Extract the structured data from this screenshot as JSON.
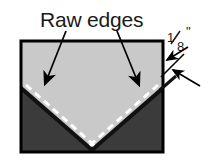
{
  "diagram": {
    "title": "Raw edges",
    "labels": {
      "raw_edges": "Raw edges",
      "seam_allowance_numerator": "1",
      "seam_allowance_denominator": "8",
      "seam_allowance_unit": "\""
    },
    "colors": {
      "background": "#ffffff",
      "fabric_light": "#c9c9c9",
      "fabric_dark": "#3b3b3b",
      "outline": "#000000",
      "stitch_line": "#ffffff",
      "text": "#1a1a1a",
      "arrow": "#000000"
    },
    "panel": {
      "x": 21,
      "y": 41,
      "width": 142,
      "height": 111,
      "border_width": 3
    },
    "fold": {
      "left_start_x": 21,
      "left_start_y": 88,
      "vertex_x": 92,
      "vertex_y": 150,
      "right_end_x": 163,
      "right_end_y": 88,
      "edge_width": 4,
      "overshoot_x": 14,
      "overshoot_y": 12
    },
    "stitching": {
      "dash_pattern": "7 5",
      "width": 3,
      "offset": 7
    },
    "callouts": [
      {
        "name": "raw-edge-left",
        "from_x": 66,
        "from_y": 27,
        "to_x": 44,
        "to_y": 86
      },
      {
        "name": "raw-edge-right",
        "from_x": 117,
        "from_y": 27,
        "to_x": 140,
        "to_y": 87
      }
    ],
    "dimension": {
      "name": "seam-allowance",
      "upper_leader_from_x": 187,
      "upper_leader_from_y": 46,
      "upper_arrow_x": 164,
      "upper_arrow_y": 61,
      "lower_leader_from_x": 199,
      "lower_leader_from_y": 86,
      "lower_arrow_x": 170,
      "lower_arrow_y": 71,
      "tick_x1": 162,
      "tick_y1": 76,
      "tick_x2": 183,
      "tick_y2": 55,
      "label_x": 176,
      "label_y": 46
    }
  }
}
